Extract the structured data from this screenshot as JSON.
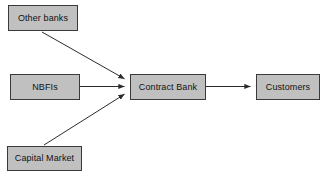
{
  "diagram": {
    "background_color": "#ffffff",
    "node_fill_color": "#c0c0c0",
    "node_border_color": "#3a3a3a",
    "connector_color": "#2b2b2b",
    "text_color": "#111111",
    "nodes": [
      {
        "id": "other-banks",
        "label": "Other banks",
        "x": 8,
        "y": 5,
        "width": 70,
        "height": 26
      },
      {
        "id": "nbfis",
        "label": "NBFIs",
        "x": 10,
        "y": 74,
        "width": 70,
        "height": 26
      },
      {
        "id": "capital-market",
        "label": "Capital Market",
        "x": 7,
        "y": 146,
        "width": 75,
        "height": 25
      },
      {
        "id": "contract-bank",
        "label": "Contract Bank",
        "x": 130,
        "y": 74,
        "width": 76,
        "height": 26
      },
      {
        "id": "customers",
        "label": "Customers",
        "x": 256,
        "y": 74,
        "width": 64,
        "height": 26
      }
    ],
    "connectors": [
      {
        "id": "other-banks-to-contract-bank",
        "from": "other-banks",
        "to": "contract-bank",
        "kind": "diagonal-down",
        "x1": 42,
        "y1": 32,
        "x2": 126,
        "y2": 79
      },
      {
        "id": "nbfis-to-contract-bank",
        "from": "nbfis",
        "to": "contract-bank",
        "kind": "horizontal",
        "x1": 80,
        "y1": 86.5,
        "x2": 126,
        "y2": 86.5
      },
      {
        "id": "capital-market-to-contract-bank",
        "from": "capital-market",
        "to": "contract-bank",
        "kind": "diagonal-up",
        "x1": 44,
        "y1": 145,
        "x2": 126,
        "y2": 94
      },
      {
        "id": "contract-bank-to-customers",
        "from": "contract-bank",
        "to": "customers",
        "kind": "horizontal",
        "x1": 206,
        "y1": 86.5,
        "x2": 252,
        "y2": 86.5
      }
    ]
  }
}
